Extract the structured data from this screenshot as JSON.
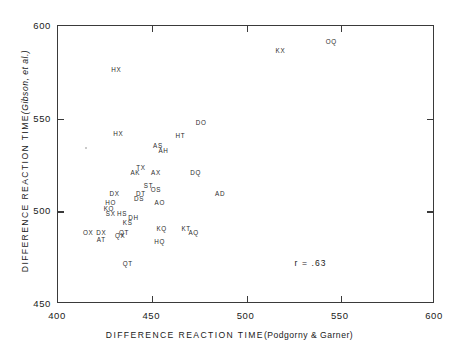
{
  "chart_data": {
    "type": "scatter",
    "title": "",
    "xlabel": "DIFFERENCE REACTION TIME (Podgorny & Garner)",
    "xlabel_main": "DIFFERENCE  REACTION  TIME",
    "xlabel_paren": "(Podgorny & Garner)",
    "ylabel": "DIFFERENCE REACTION TIME (Gibson, et al.)",
    "ylabel_main": "DIFFERENCE  REACTION  TIME",
    "ylabel_paren": "(Gibson, et al.)",
    "xlim": [
      400,
      600
    ],
    "ylim": [
      450,
      600
    ],
    "xticks": [
      400,
      450,
      500,
      550,
      600
    ],
    "xtick_labels": [
      "400",
      "450",
      "500",
      "550",
      "600"
    ],
    "yticks": [
      450,
      500,
      550,
      600
    ],
    "ytick_labels": [
      "450",
      "500",
      "550",
      "600"
    ],
    "grid": false,
    "legend": null,
    "marker_style": "text-label",
    "annotations": [
      {
        "name": "correlation",
        "text": "r = .63",
        "x": 534,
        "y": 472
      }
    ],
    "points": [
      {
        "label": "OQ",
        "x": 545,
        "y": 592
      },
      {
        "label": "KX",
        "x": 518,
        "y": 587
      },
      {
        "label": "HX",
        "x": 431,
        "y": 577
      },
      {
        "label": "DO",
        "x": 476,
        "y": 548
      },
      {
        "label": "HX",
        "x": 432,
        "y": 542
      },
      {
        "label": "HT",
        "x": 465,
        "y": 541
      },
      {
        "label": "AS",
        "x": 453,
        "y": 536
      },
      {
        "label": "AH",
        "x": 456,
        "y": 533
      },
      {
        "label": "TX",
        "x": 444,
        "y": 524
      },
      {
        "label": "AK",
        "x": 441,
        "y": 521
      },
      {
        "label": "AX",
        "x": 452,
        "y": 521
      },
      {
        "label": "DQ",
        "x": 473,
        "y": 521
      },
      {
        "label": "ST",
        "x": 448,
        "y": 514
      },
      {
        "label": "OS",
        "x": 452,
        "y": 512
      },
      {
        "label": "DX",
        "x": 430,
        "y": 510
      },
      {
        "label": "DT",
        "x": 444,
        "y": 510
      },
      {
        "label": "AD",
        "x": 486,
        "y": 510
      },
      {
        "label": "DS",
        "x": 443,
        "y": 507
      },
      {
        "label": "HO",
        "x": 428,
        "y": 505
      },
      {
        "label": "AO",
        "x": 454,
        "y": 505
      },
      {
        "label": "KO",
        "x": 427,
        "y": 502
      },
      {
        "label": "SX",
        "x": 428,
        "y": 499
      },
      {
        "label": "HS",
        "x": 434,
        "y": 499
      },
      {
        "label": "DH",
        "x": 440,
        "y": 497
      },
      {
        "label": "KS",
        "x": 437,
        "y": 494
      },
      {
        "label": "KQ",
        "x": 455,
        "y": 491
      },
      {
        "label": "KT",
        "x": 468,
        "y": 491
      },
      {
        "label": "AQ",
        "x": 472,
        "y": 489
      },
      {
        "label": "OX",
        "x": 416,
        "y": 489
      },
      {
        "label": "DX",
        "x": 423,
        "y": 489
      },
      {
        "label": "QT",
        "x": 435,
        "y": 489
      },
      {
        "label": "QX",
        "x": 433,
        "y": 487
      },
      {
        "label": "AT",
        "x": 423,
        "y": 485
      },
      {
        "label": "HQ",
        "x": 454,
        "y": 484
      },
      {
        "label": "QT",
        "x": 437,
        "y": 472
      }
    ],
    "faint_marks": [
      {
        "x": 415,
        "y": 534
      }
    ]
  }
}
